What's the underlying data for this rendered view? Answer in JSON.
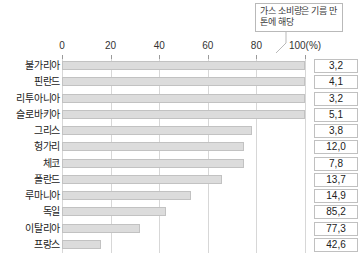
{
  "callout": {
    "text": "가스 소비량은 기름 만 톤에 해당",
    "name": "gas-consumption-note"
  },
  "axis": {
    "unit_label": "100(%)",
    "ticks": [
      "0",
      "20",
      "40",
      "60",
      "80",
      "100(%)"
    ],
    "tick_values": [
      0,
      20,
      40,
      60,
      80,
      100
    ],
    "min": 0,
    "max": 100
  },
  "colors": {
    "bar_fill": "#dcdcdc",
    "bar_border": "#c2c2c2",
    "gridline": "#d7d7d7",
    "axis": "#8c8c8c",
    "text": "#222222",
    "box_border": "#c0c0c0"
  },
  "chart_data": {
    "type": "bar",
    "orientation": "horizontal",
    "title": "",
    "xlabel": "100(%)",
    "ylabel": "",
    "xlim": [
      0,
      100
    ],
    "grid": true,
    "legend": false,
    "categories": [
      "불가리아",
      "핀란드",
      "리투아니아",
      "슬로바키아",
      "그리스",
      "헝가리",
      "체코",
      "폴란드",
      "루마니아",
      "독일",
      "이탈리아",
      "프랑스"
    ],
    "values": [
      100,
      100,
      100,
      100,
      78,
      75,
      75,
      66,
      53,
      43,
      32,
      16
    ],
    "data_labels": [
      "3,2",
      "4,1",
      "3,2",
      "5,1",
      "3,8",
      "12,0",
      "7,8",
      "13,7",
      "14,9",
      "85,2",
      "77,3",
      "42,6"
    ],
    "data_label_header": ""
  }
}
